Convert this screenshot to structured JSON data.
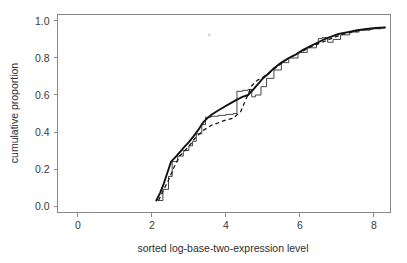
{
  "chart_data": {
    "type": "line",
    "title": "",
    "subtitle": "",
    "xlabel": "sorted log-base-two-expression level",
    "ylabel": "cumulative proportion",
    "xlim": [
      -0.55,
      8.45
    ],
    "ylim": [
      -0.035,
      1.035
    ],
    "xticks": [
      0,
      2,
      4,
      6,
      8
    ],
    "xticklabels": [
      "0",
      "2",
      "4",
      "6",
      "8"
    ],
    "yticks": [
      0.0,
      0.2,
      0.4,
      0.6,
      0.8,
      1.0
    ],
    "yticklabels": [
      "0.0",
      "0.2",
      "0.4",
      "0.6",
      "0.8",
      "1.0"
    ],
    "grid": false,
    "legend": null,
    "legend_position": "none",
    "series": [
      {
        "name": "solid-thick-ecdf",
        "style": "solid",
        "linewidth": 1.9,
        "color": "#111111",
        "x": [
          2.12,
          2.22,
          2.32,
          2.42,
          2.52,
          2.62,
          2.75,
          2.88,
          3.0,
          3.12,
          3.25,
          3.38,
          3.5,
          3.62,
          3.78,
          3.95,
          4.12,
          4.3,
          4.45,
          4.6,
          4.72,
          4.85,
          5.0,
          5.15,
          5.3,
          5.5,
          5.7,
          5.9,
          6.1,
          6.3,
          6.5,
          6.65,
          6.85,
          7.05,
          7.3,
          7.55,
          7.8,
          8.05,
          8.3
        ],
        "y": [
          0.03,
          0.07,
          0.12,
          0.18,
          0.24,
          0.26,
          0.29,
          0.32,
          0.345,
          0.375,
          0.41,
          0.45,
          0.475,
          0.495,
          0.515,
          0.535,
          0.555,
          0.575,
          0.59,
          0.6,
          0.625,
          0.655,
          0.69,
          0.715,
          0.745,
          0.775,
          0.8,
          0.82,
          0.845,
          0.865,
          0.885,
          0.9,
          0.915,
          0.93,
          0.94,
          0.95,
          0.957,
          0.962,
          0.965
        ]
      },
      {
        "name": "thin-step-ecdf",
        "style": "step",
        "linewidth": 0.8,
        "color": "#1a1a1a",
        "x": [
          2.15,
          2.3,
          2.45,
          2.55,
          2.7,
          2.85,
          3.0,
          3.1,
          3.2,
          3.35,
          3.45,
          3.6,
          3.8,
          4.0,
          4.2,
          4.3,
          4.45,
          4.6,
          4.7,
          4.8,
          4.95,
          5.1,
          5.3,
          5.5,
          5.7,
          5.95,
          6.2,
          6.45,
          6.5,
          6.6,
          6.75,
          6.9,
          7.1,
          7.35,
          7.6,
          7.9,
          8.2,
          8.3
        ],
        "y": [
          0.03,
          0.09,
          0.16,
          0.24,
          0.27,
          0.3,
          0.325,
          0.35,
          0.39,
          0.44,
          0.48,
          0.485,
          0.49,
          0.495,
          0.5,
          0.62,
          0.625,
          0.63,
          0.59,
          0.6,
          0.645,
          0.69,
          0.735,
          0.775,
          0.8,
          0.83,
          0.855,
          0.875,
          0.905,
          0.91,
          0.885,
          0.9,
          0.925,
          0.94,
          0.95,
          0.958,
          0.964,
          0.965
        ]
      },
      {
        "name": "dashed-ecdf",
        "style": "dashed",
        "linewidth": 1.25,
        "color": "#141414",
        "x": [
          2.18,
          2.3,
          2.45,
          2.6,
          2.75,
          2.9,
          3.05,
          3.2,
          3.4,
          3.6,
          3.8,
          4.0,
          4.2,
          4.4,
          4.55,
          4.7,
          4.85,
          5.0,
          5.2,
          5.4,
          5.6,
          5.85,
          6.1,
          6.35,
          6.6,
          6.85,
          7.1,
          7.4,
          7.7,
          8.0,
          8.3
        ],
        "y": [
          0.03,
          0.08,
          0.14,
          0.21,
          0.27,
          0.3,
          0.335,
          0.375,
          0.41,
          0.435,
          0.45,
          0.465,
          0.475,
          0.51,
          0.58,
          0.65,
          0.68,
          0.695,
          0.725,
          0.755,
          0.785,
          0.815,
          0.84,
          0.865,
          0.885,
          0.905,
          0.925,
          0.94,
          0.952,
          0.96,
          0.965
        ]
      }
    ],
    "annotations": [
      {
        "name": "faint-speck",
        "x": 3.55,
        "y": 0.925
      }
    ]
  }
}
